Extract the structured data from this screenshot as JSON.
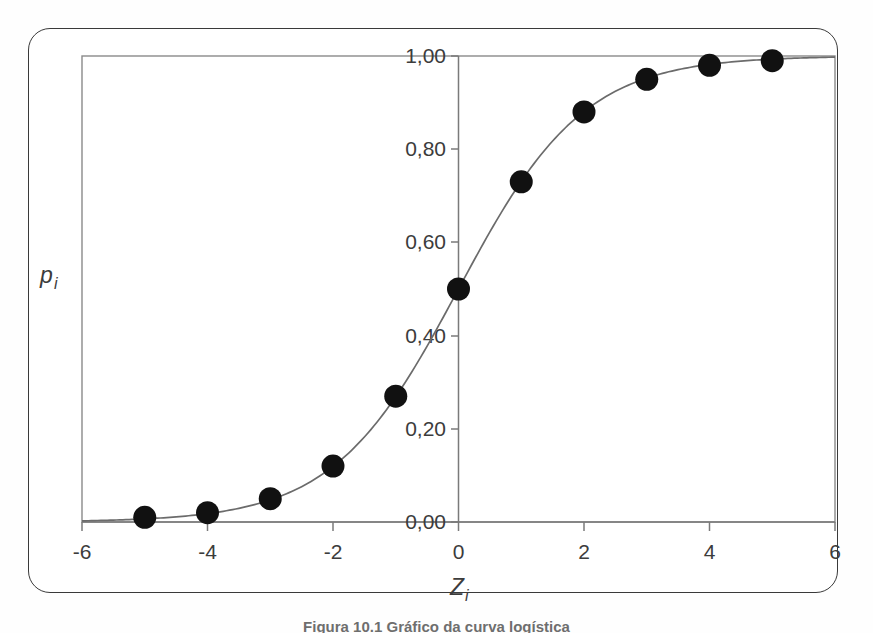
{
  "figure": {
    "caption": "Figura 10.1   Gráfico da curva logística",
    "background_color": "#ffffff",
    "frame_color": "#3a3a3a",
    "axis_color": "#7a7a7a",
    "curve_color": "#6b6b6b",
    "marker_color": "#111111"
  },
  "chart_data": {
    "type": "scatter",
    "title": "",
    "subtitle": "",
    "xlabel": "Zi",
    "xlabel_base": "Z",
    "xlabel_sub": "i",
    "ylabel": "pi",
    "ylabel_base": "p",
    "ylabel_sub": "i",
    "xlim": [
      -6,
      6
    ],
    "ylim": [
      0.0,
      1.0
    ],
    "grid": false,
    "legend": "none",
    "x_ticks": [
      -6,
      -4,
      -2,
      0,
      2,
      4,
      6
    ],
    "x_tick_labels": [
      "-6",
      "-4",
      "-2",
      "0",
      "2",
      "4",
      "6"
    ],
    "y_ticks": [
      0.0,
      0.2,
      0.4,
      0.6,
      0.8,
      1.0
    ],
    "y_tick_labels": [
      "0,00",
      "0,20",
      "0,40",
      "0,60",
      "0,80",
      "1,00"
    ],
    "decimal_separator": ",",
    "x": [
      -5,
      -4,
      -3,
      -2,
      -1,
      0,
      1,
      2,
      3,
      4,
      5
    ],
    "values": [
      0.01,
      0.02,
      0.05,
      0.12,
      0.27,
      0.5,
      0.73,
      0.88,
      0.95,
      0.98,
      0.99
    ],
    "series": [
      {
        "name": "logistic",
        "marker": "filled-circle",
        "line": "solid",
        "values": [
          0.01,
          0.02,
          0.05,
          0.12,
          0.27,
          0.5,
          0.73,
          0.88,
          0.95,
          0.98,
          0.99
        ]
      }
    ],
    "curve_formula": "p = 1 / (1 + exp(-z))",
    "annotations": []
  }
}
